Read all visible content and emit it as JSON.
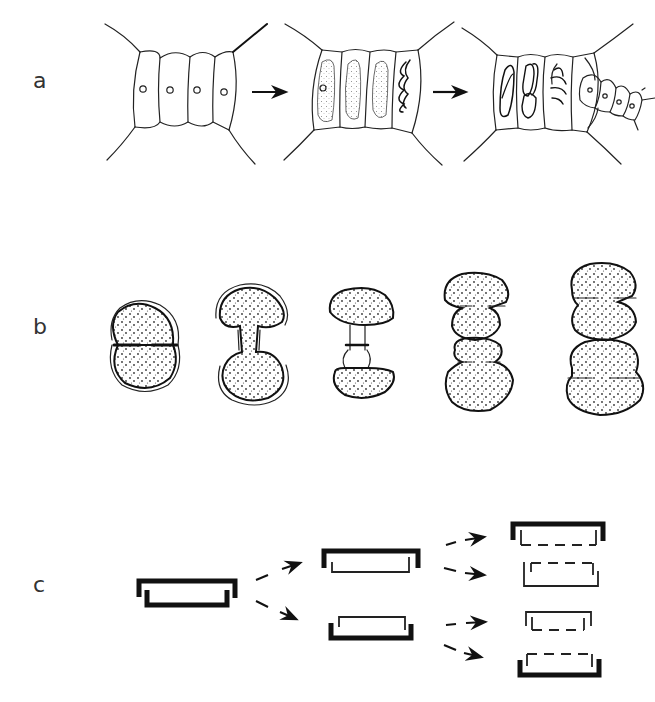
{
  "figure": {
    "panels": [
      {
        "label": "a",
        "description": "Filament cell division sequence: four-cell filament segment with nuclei, arrow, cells with stippled chloroplasts and spiral bands, arrow, cells with dividing content and a new small four-cell filament branching off",
        "stages": 3,
        "arrows": 2
      },
      {
        "label": "b",
        "description": "Desmid (Cosmarium-like) cell division sequence: single constricted cell, elongating isthmus, new semicells forming, two daughter cells, two complete daughter cells",
        "stages": 5
      },
      {
        "label": "c",
        "description": "Diatom frustule division: parent frustule (epitheca over hypotheca) splits into two daughter frustules, each forming a new hypotheca (dashed), yielding four frustules",
        "stages": 3,
        "legend_notes": {
          "thick": "oldest valve",
          "thin": "intermediate valve",
          "dashed": "newly formed valve"
        }
      }
    ]
  }
}
